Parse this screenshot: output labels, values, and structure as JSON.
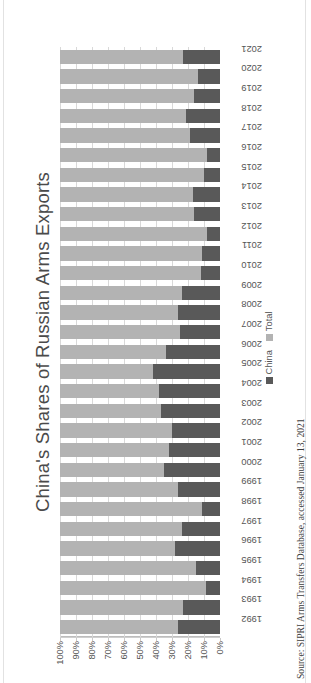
{
  "figure": {
    "title": "China's Shares of Russian Arms Exports",
    "source_note": "Source: SIPRI Arms Transfers Database, accessed January 13, 2021"
  },
  "legend": {
    "position": "right",
    "items": [
      {
        "label": "China",
        "color": "#595959"
      },
      {
        "label": "Total",
        "color": "#b3b3b3"
      }
    ]
  },
  "colors": {
    "china": "#595959",
    "total": "#b3b3b3",
    "gridline": "#d9d9d9",
    "axis": "#bdbdbd",
    "text": "#555555"
  },
  "chart_data": {
    "type": "bar",
    "orientation": "horizontal-rotated",
    "stacked": true,
    "title": "China's Shares of Russian Arms Exports",
    "xlabel": "",
    "ylabel": "",
    "ylim": [
      0,
      100
    ],
    "grid": true,
    "legend_position": "right",
    "tick_labels": [
      "100%",
      "90%",
      "80%",
      "70%",
      "60%",
      "50%",
      "40%",
      "30%",
      "20%",
      "10%",
      "0%"
    ],
    "categories": [
      "1992",
      "1993",
      "1994",
      "1995",
      "1996",
      "1997",
      "1998",
      "1999",
      "2000",
      "2001",
      "2002",
      "2003",
      "2004",
      "2005",
      "2006",
      "2007",
      "2008",
      "2009",
      "2010",
      "2011",
      "2012",
      "2013",
      "2014",
      "2015",
      "2016",
      "2017",
      "2018",
      "2019",
      "2020",
      "2021"
    ],
    "series": [
      {
        "name": "China",
        "color": "#595959",
        "values": [
          26,
          23,
          9,
          15,
          28,
          24,
          11,
          26,
          35,
          32,
          30,
          37,
          38,
          42,
          34,
          25,
          26,
          24,
          12,
          11,
          8,
          16,
          17,
          10,
          8,
          19,
          21,
          16,
          14,
          23
        ]
      },
      {
        "name": "Total",
        "color": "#b3b3b3",
        "values": [
          74,
          77,
          91,
          85,
          72,
          76,
          89,
          74,
          65,
          68,
          70,
          63,
          62,
          58,
          66,
          75,
          74,
          76,
          88,
          89,
          92,
          84,
          83,
          90,
          92,
          81,
          79,
          84,
          86,
          77
        ]
      }
    ]
  }
}
